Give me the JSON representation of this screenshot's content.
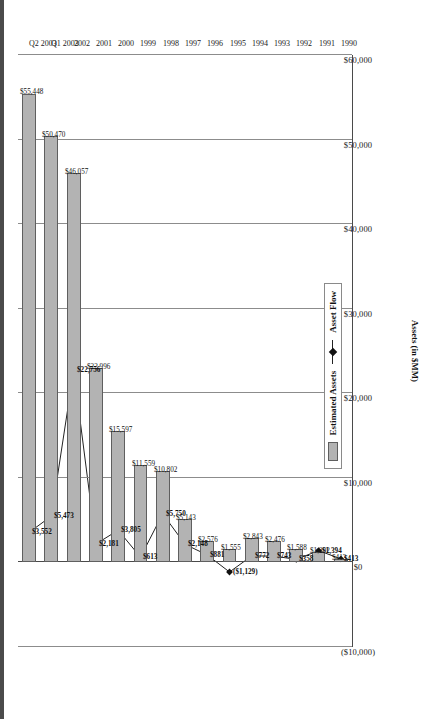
{
  "chart_data": {
    "type": "bar",
    "title": "",
    "xlabel": "",
    "ylabel": "Assets (in $MM)",
    "ylim": [
      -10000,
      60000
    ],
    "grid": true,
    "legend_position": "bottom-right",
    "orientation": "rotated-90",
    "categories": [
      "1990",
      "1991",
      "1992",
      "1993",
      "1994",
      "1995",
      "1996",
      "1997",
      "1998",
      "1999",
      "2000",
      "2001",
      "2002",
      "Q1 2003",
      "Q2 2003"
    ],
    "series": [
      {
        "name": "Estimated Assets",
        "type": "bar",
        "values": [
          413,
          1202,
          1588,
          2476,
          2843,
          1555,
          2576,
          5143,
          10802,
          11559,
          15597,
          22996,
          46057,
          50470,
          55448
        ],
        "labels": [
          "$413",
          "$1,202",
          "$1,588",
          "$2,476",
          "$2,843",
          "$1,555",
          "$2,576",
          "$5,143",
          "$10,802",
          "$11,559",
          "$15,597",
          "$22,996",
          "$46,057",
          "$50,470",
          "$55,448"
        ]
      },
      {
        "name": "Asset Flow",
        "type": "line",
        "values": [
          413,
          1394,
          358,
          743,
          772,
          -1129,
          881,
          2148,
          5750,
          613,
          3805,
          2181,
          22756,
          5473,
          3552
        ],
        "labels": [
          "$413",
          "$1,394",
          "$358",
          "$743",
          "$772",
          "($1,129)",
          "$881",
          "$2,148",
          "$5,750",
          "$613",
          "$3,805",
          "$2,181",
          "$22,756",
          "$5,473",
          "$3,552"
        ]
      }
    ],
    "value_axis_ticks": [
      "$60,000",
      "$50,000",
      "$40,000",
      "$30,000",
      "$20,000",
      "$10,000",
      "$0",
      "($10,000)"
    ],
    "value_axis_tick_values": [
      60000,
      50000,
      40000,
      30000,
      20000,
      10000,
      0,
      -10000
    ],
    "colors": {
      "bar_fill": "#b3b3b3",
      "bar_border": "#5f5f5f",
      "line": "#222222",
      "marker": "#111111",
      "grid": "#8c8c8c"
    }
  },
  "legend": {
    "items": [
      {
        "label": "Estimated Assets",
        "marker": "bar-swatch"
      },
      {
        "label": "Asset Flow",
        "marker": "line-marker-swatch"
      }
    ]
  }
}
